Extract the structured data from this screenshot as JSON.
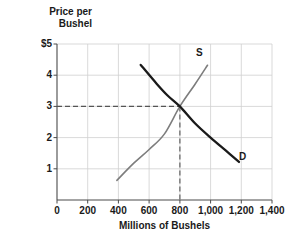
{
  "chart_data": {
    "type": "line",
    "title": "",
    "xlabel": "Millions of Bushels",
    "ylabel": "Price per\nBushel",
    "ylabel_line1": "Price per",
    "ylabel_line2": "Bushel",
    "xlim": [
      0,
      1400
    ],
    "ylim": [
      0,
      5
    ],
    "grid": true,
    "legend_position": "inline-curve-labels",
    "xticks": [
      0,
      200,
      400,
      600,
      800,
      1000,
      1200,
      1400
    ],
    "xtick_labels": [
      "0",
      "200",
      "400",
      "600",
      "800",
      "1,000",
      "1,200",
      "1,400"
    ],
    "yticks": [
      0,
      1,
      2,
      3,
      4,
      5
    ],
    "ytick_labels": [
      "0",
      "1",
      "2",
      "3",
      "4",
      "$5"
    ],
    "series": [
      {
        "name": "S",
        "label": "S",
        "role": "supply",
        "color": "#7d7d7d",
        "width": 1.6,
        "points": [
          {
            "x": 390,
            "y": 0.63
          },
          {
            "x": 500,
            "y": 1.18
          },
          {
            "x": 600,
            "y": 1.62
          },
          {
            "x": 700,
            "y": 2.12
          },
          {
            "x": 800,
            "y": 3.0
          },
          {
            "x": 900,
            "y": 3.72
          },
          {
            "x": 980,
            "y": 4.32
          }
        ]
      },
      {
        "name": "D",
        "label": "D",
        "role": "demand",
        "color": "#1a1a1a",
        "width": 2.3,
        "points": [
          {
            "x": 545,
            "y": 4.33
          },
          {
            "x": 650,
            "y": 3.72
          },
          {
            "x": 720,
            "y": 3.35
          },
          {
            "x": 800,
            "y": 3.0
          },
          {
            "x": 900,
            "y": 2.45
          },
          {
            "x": 1000,
            "y": 2.0
          },
          {
            "x": 1100,
            "y": 1.58
          },
          {
            "x": 1185,
            "y": 1.22
          }
        ]
      }
    ],
    "equilibrium": {
      "x": 800,
      "y": 3,
      "price_label": "3",
      "quantity_label": "800",
      "guide_style": "dashed",
      "guide_color": "#555555"
    },
    "annotations": [
      {
        "text": "S",
        "x": 960,
        "y": 4.63
      },
      {
        "text": "D",
        "x": 1245,
        "y": 1.43
      }
    ]
  }
}
